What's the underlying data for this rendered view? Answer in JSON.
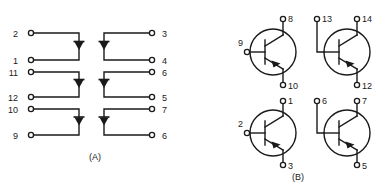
{
  "figure": {
    "background_color": "#ffffff",
    "line_color": "#1a1a1a",
    "panels": [
      {
        "id": "panel-a",
        "caption": "(A)",
        "type": "diode-array",
        "description": "Six diode branches arranged in two mirrored columns of three",
        "caption_x": 95,
        "caption_y": 160,
        "branches": [
          {
            "id": "a1",
            "side": "left",
            "anode_pin": "2",
            "cathode_pin": "1",
            "top_label": "2",
            "bottom_label": "1",
            "label_x": 18,
            "term_x": 31,
            "top_y": 33,
            "bottom_y": 60,
            "corner_x": 79,
            "diode_dir": "down"
          },
          {
            "id": "a2",
            "side": "right",
            "top_label": "3",
            "bottom_label": "4",
            "label_x": 162,
            "term_x": 152,
            "top_y": 33,
            "bottom_y": 60,
            "corner_x": 104,
            "diode_dir": "down"
          },
          {
            "id": "a3",
            "side": "left",
            "top_label": "11",
            "bottom_label": "12",
            "label_x": 14,
            "term_x": 31,
            "top_y": 72,
            "bottom_y": 97,
            "corner_x": 79,
            "diode_dir": "down"
          },
          {
            "id": "a4",
            "side": "right",
            "top_label": "6",
            "bottom_label": "5",
            "label_x": 162,
            "term_x": 152,
            "top_y": 72,
            "bottom_y": 97,
            "corner_x": 104,
            "diode_dir": "down"
          },
          {
            "id": "a5",
            "side": "left",
            "top_label": "10",
            "bottom_label": "9",
            "label_x": 14,
            "term_x": 31,
            "top_y": 109,
            "bottom_y": 135,
            "corner_x": 79,
            "diode_dir": "down"
          },
          {
            "id": "a6",
            "side": "right",
            "top_label": "7",
            "bottom_label": "6",
            "label_x": 162,
            "term_x": 152,
            "top_y": 109,
            "bottom_y": 135,
            "corner_x": 104,
            "diode_dir": "down"
          }
        ]
      },
      {
        "id": "panel-b",
        "caption": "(B)",
        "type": "transistor-array",
        "description": "Four NPN bipolar transistors in a two by two arrangement",
        "caption_x": 298,
        "caption_y": 174,
        "transistors": [
          {
            "id": "b1",
            "device": "npn",
            "center_x": 273,
            "center_y": 52,
            "radius": 23,
            "collector_pin": "8",
            "collector_label_x": 288,
            "collector_label_y": 17,
            "base_pin": "9",
            "base_label_x": 226,
            "base_label_y": 43,
            "base_route": "direct",
            "emitter_pin": "10",
            "emitter_label_x": 288,
            "emitter_label_y": 92
          },
          {
            "id": "b2",
            "device": "npn",
            "center_x": 347,
            "center_y": 52,
            "radius": 23,
            "collector_pin": "14",
            "collector_label_x": 362,
            "collector_label_y": 17,
            "base_pin": "13",
            "base_label_x": 320,
            "base_label_y": 17,
            "base_route": "top-left",
            "emitter_pin": "12",
            "emitter_label_x": 362,
            "emitter_label_y": 92
          },
          {
            "id": "b3",
            "device": "npn",
            "center_x": 273,
            "center_y": 133,
            "radius": 23,
            "collector_pin": "1",
            "collector_label_x": 288,
            "collector_label_y": 99,
            "base_pin": "2",
            "base_label_x": 226,
            "base_label_y": 124,
            "base_route": "direct",
            "emitter_pin": "3",
            "emitter_label_x": 288,
            "emitter_label_y": 172
          },
          {
            "id": "b4",
            "device": "npn",
            "center_x": 347,
            "center_y": 133,
            "radius": 23,
            "collector_pin": "7",
            "collector_label_x": 362,
            "collector_label_y": 99,
            "base_pin": "6",
            "base_label_x": 320,
            "base_label_y": 99,
            "base_route": "top-left",
            "emitter_pin": "5",
            "emitter_label_x": 362,
            "emitter_label_y": 172
          }
        ]
      }
    ]
  }
}
